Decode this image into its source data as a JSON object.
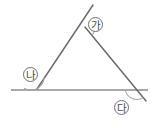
{
  "figure": {
    "background_color": "#ffffff",
    "line_color": "#6b6b6b",
    "arc_color": "#9a9a9a",
    "label_color": "#4a4a4a",
    "width": 156,
    "height": 126
  },
  "labels": {
    "apex": "㆞",
    "left": "㆟",
    "right": "ㆠ",
    "apex_text": "가",
    "left_text": "나",
    "right_text": "다"
  },
  "geometry": {
    "apex": {
      "x": 85,
      "y": 27
    },
    "left_vertex": {
      "x": 37,
      "y": 89
    },
    "right_vertex": {
      "x": 137,
      "y": 89
    },
    "baseline_start": {
      "x": 11,
      "y": 90
    },
    "baseline_end": {
      "x": 148,
      "y": 90
    },
    "left_ray_end": {
      "x": 93,
      "y": 5
    },
    "right_ray_end": {
      "x": 146,
      "y": 101
    },
    "apex_arc_radius": 11,
    "left_arc_radius": 12,
    "right_arc_radius": 12
  }
}
